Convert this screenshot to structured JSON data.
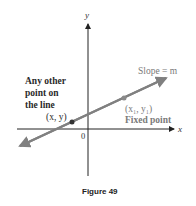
{
  "figure": {
    "caption": "Figure 49",
    "axes": {
      "x_label": "x",
      "y_label": "y",
      "origin_label": "0"
    },
    "line": {
      "slope_label": "Slope = m",
      "color": "#808080"
    },
    "points": [
      {
        "label": "(x, y)",
        "description": "Any other point on the line",
        "description_lines": [
          "Any other",
          "point on",
          "the line"
        ],
        "color": "#333333"
      },
      {
        "label": "(x₁, y₁)",
        "description": "Fixed point",
        "color": "#8a8a8a"
      }
    ]
  }
}
